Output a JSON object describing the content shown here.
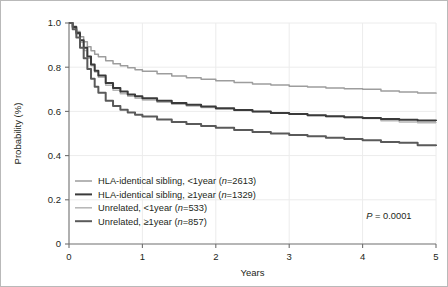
{
  "chart_data": {
    "type": "line",
    "title": "",
    "xlabel": "Years",
    "ylabel": "Probability (%)",
    "xlim": [
      0,
      5
    ],
    "ylim": [
      0,
      1.0
    ],
    "grid": true,
    "legend_position": "lower-left",
    "xticks": [
      "0",
      "1",
      "2",
      "3",
      "4",
      "5"
    ],
    "xtick_values": [
      0,
      1,
      2,
      3,
      4,
      5
    ],
    "yticks": [
      "0",
      "0.2",
      "0.4",
      "0.6",
      "0.8",
      "1.0"
    ],
    "ytick_values": [
      0,
      0.2,
      0.4,
      0.6,
      0.8,
      1.0
    ],
    "annotations": [
      {
        "name": "p-value",
        "text_italic": "P",
        "text_rest": " = 0.0001",
        "x": 4.05,
        "y": 0.115
      }
    ],
    "series": [
      {
        "name": "HLA-identical sibling, <1year (n=2613)",
        "label_main": "HLA-identical sibling, <1year (",
        "label_italic": "n",
        "label_tail": "=2613)",
        "n": 2613,
        "color": "#9d9d9d",
        "width": 1.5,
        "x": [
          0,
          0.05,
          0.1,
          0.15,
          0.2,
          0.25,
          0.3,
          0.35,
          0.4,
          0.5,
          0.6,
          0.7,
          0.8,
          0.9,
          1.0,
          1.2,
          1.4,
          1.6,
          1.8,
          2.0,
          2.25,
          2.5,
          2.75,
          3.0,
          3.25,
          3.5,
          3.75,
          4.0,
          4.25,
          4.5,
          4.75,
          5.0
        ],
        "y": [
          1.0,
          0.985,
          0.962,
          0.938,
          0.915,
          0.893,
          0.874,
          0.859,
          0.847,
          0.829,
          0.816,
          0.806,
          0.797,
          0.789,
          0.782,
          0.77,
          0.76,
          0.752,
          0.745,
          0.739,
          0.731,
          0.724,
          0.719,
          0.714,
          0.71,
          0.706,
          0.703,
          0.7,
          0.692,
          0.688,
          0.683,
          0.68
        ]
      },
      {
        "name": "HLA-identical sibling, >=1year (n=1329)",
        "label_main": "HLA-identical sibling, ≥1year (",
        "label_italic": "n",
        "label_tail": "=1329)",
        "n": 1329,
        "color": "#3a3a3a",
        "width": 2.0,
        "x": [
          0,
          0.05,
          0.1,
          0.15,
          0.2,
          0.25,
          0.3,
          0.35,
          0.4,
          0.5,
          0.6,
          0.7,
          0.8,
          0.9,
          1.0,
          1.2,
          1.4,
          1.6,
          1.8,
          2.0,
          2.25,
          2.5,
          2.75,
          3.0,
          3.25,
          3.5,
          3.75,
          4.0,
          4.25,
          4.5,
          4.75,
          5.0
        ],
        "y": [
          1.0,
          0.982,
          0.955,
          0.922,
          0.888,
          0.848,
          0.812,
          0.784,
          0.762,
          0.729,
          0.706,
          0.69,
          0.677,
          0.668,
          0.66,
          0.648,
          0.638,
          0.63,
          0.622,
          0.614,
          0.606,
          0.599,
          0.593,
          0.588,
          0.583,
          0.578,
          0.574,
          0.57,
          0.566,
          0.562,
          0.559,
          0.557
        ]
      },
      {
        "name": "Unrelated, <1year (n=533)",
        "label_main": "Unrelated, <1year (",
        "label_italic": "n",
        "label_tail": "=533)",
        "n": 533,
        "color": "#b5b5b5",
        "width": 1.5,
        "x": [
          0,
          0.05,
          0.1,
          0.15,
          0.2,
          0.25,
          0.3,
          0.35,
          0.4,
          0.5,
          0.6,
          0.7,
          0.8,
          0.9,
          1.0,
          1.2,
          1.4,
          1.6,
          1.8,
          2.0,
          2.25,
          2.5,
          2.75,
          3.0,
          3.25,
          3.5,
          3.75,
          4.0,
          4.25,
          4.5,
          4.75,
          5.0
        ],
        "y": [
          1.0,
          0.978,
          0.948,
          0.913,
          0.876,
          0.84,
          0.806,
          0.778,
          0.754,
          0.718,
          0.696,
          0.68,
          0.668,
          0.659,
          0.652,
          0.641,
          0.632,
          0.625,
          0.618,
          0.611,
          0.604,
          0.598,
          0.592,
          0.587,
          0.582,
          0.577,
          0.572,
          0.568,
          0.558,
          0.552,
          0.549,
          0.548
        ]
      },
      {
        "name": "Unrelated, >=1year (n=857)",
        "label_main": "Unrelated, ≥1year (",
        "label_italic": "n",
        "label_tail": "=857)",
        "n": 857,
        "color": "#5a5a5a",
        "width": 2.0,
        "x": [
          0,
          0.05,
          0.1,
          0.15,
          0.2,
          0.25,
          0.3,
          0.35,
          0.4,
          0.5,
          0.6,
          0.7,
          0.8,
          0.9,
          1.0,
          1.2,
          1.4,
          1.6,
          1.8,
          2.0,
          2.25,
          2.5,
          2.75,
          3.0,
          3.25,
          3.5,
          3.75,
          4.0,
          4.25,
          4.5,
          4.75,
          5.0
        ],
        "y": [
          1.0,
          0.972,
          0.934,
          0.888,
          0.84,
          0.792,
          0.748,
          0.712,
          0.684,
          0.648,
          0.624,
          0.608,
          0.595,
          0.585,
          0.577,
          0.563,
          0.552,
          0.543,
          0.534,
          0.526,
          0.516,
          0.507,
          0.5,
          0.493,
          0.487,
          0.481,
          0.475,
          0.469,
          0.461,
          0.458,
          0.447,
          0.444
        ]
      }
    ]
  }
}
